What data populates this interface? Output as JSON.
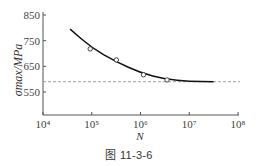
{
  "figure": {
    "caption": "图 11-3-6"
  },
  "chart_data": {
    "type": "scatter",
    "title": "",
    "xlabel": "N",
    "ylabel": "σmax/MPa",
    "xscale": "log",
    "xlim": [
      10000,
      100000000
    ],
    "ylim": [
      500,
      850
    ],
    "x_ticks": [
      10000,
      100000,
      1000000,
      10000000,
      100000000
    ],
    "x_tick_labels": [
      "10⁴",
      "10⁵",
      "10⁶",
      "10⁷",
      "10⁸"
    ],
    "y_ticks": [
      550,
      650,
      750,
      850
    ],
    "y_tick_labels": [
      "550",
      "650",
      "750",
      "850"
    ],
    "grid": false,
    "legend": null,
    "series": [
      {
        "name": "measured points",
        "style": "open-circle",
        "x": [
          93000,
          320000,
          1150000,
          3500000
        ],
        "y": [
          718,
          675,
          617,
          597
        ]
      },
      {
        "name": "fitted curve",
        "style": "solid-line",
        "x": [
          36000,
          100000,
          316000,
          1000000,
          3160000,
          10000000,
          31600000
        ],
        "y": [
          795,
          722,
          668,
          625,
          600,
          591,
          590
        ]
      },
      {
        "name": "fatigue limit",
        "style": "dashed-line",
        "y_constant": 590
      }
    ]
  }
}
